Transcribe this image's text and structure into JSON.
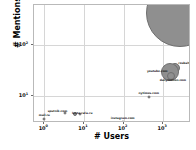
{
  "chart_data": {
    "type": "scatter",
    "title": "",
    "xlabel": "# Users",
    "ylabel": "# Mentions",
    "xscale": "log",
    "yscale": "log",
    "xlim": [
      0.55,
      5000
    ],
    "ylim": [
      3.0,
      600
    ],
    "grid": true,
    "legend": null,
    "xticks": [
      {
        "value": 1,
        "label": "10",
        "exp": "0"
      },
      {
        "value": 10,
        "label": "10",
        "exp": "1"
      },
      {
        "value": 100,
        "label": "10",
        "exp": "2"
      },
      {
        "value": 1000,
        "label": "10",
        "exp": "3"
      }
    ],
    "yticks": [
      {
        "value": 10,
        "label": "10",
        "exp": "1"
      },
      {
        "value": 100,
        "label": "10",
        "exp": "2"
      }
    ],
    "points": [
      {
        "label": "vk.com",
        "x": 2600,
        "y": 420,
        "size": 34,
        "label_dx": 0,
        "label_dy": -16
      },
      {
        "label": "rosbalt.com",
        "x": 1950,
        "y": 36,
        "size": 5,
        "label_dx": 13,
        "label_dy": -4
      },
      {
        "label": "youtube.com",
        "x": 1500,
        "y": 30,
        "size": 9,
        "label_dx": -13,
        "label_dy": 0
      },
      {
        "label": "dailymotion.com",
        "x": 1550,
        "y": 25,
        "size": 4,
        "label_dx": 2,
        "label_dy": 5
      },
      {
        "label": "nytimes.com",
        "x": 430,
        "y": 9.5,
        "size": 1.5,
        "label_dx": 0,
        "label_dy": -3
      },
      {
        "label": "sputnik.com",
        "x": 3.4,
        "y": 4.6,
        "size": 1.5,
        "label_dx": -8,
        "label_dy": -1
      },
      {
        "label": "lenta.ru",
        "x": 6.0,
        "y": 4.5,
        "size": 2,
        "label_dx": 3,
        "label_dy": 0
      },
      {
        "label": "ria.ru",
        "x": 8.0,
        "y": 4.4,
        "size": 1.5,
        "label_dx": 8,
        "label_dy": 0
      },
      {
        "label": "mail.ru",
        "x": 1.0,
        "y": 3.6,
        "size": 1.5,
        "label_dx": 0,
        "label_dy": -3
      },
      {
        "label": "instagram.com",
        "x": 95,
        "y": 3.2,
        "size": 1.5,
        "label_dx": 0,
        "label_dy": -3
      }
    ]
  },
  "colors": {
    "bubble_fill": "#8f8f8f",
    "bubble_edge": "#6f6f6f",
    "grid": "#d6d6d6",
    "frame": "#b9b9b9",
    "text": "#111111"
  }
}
